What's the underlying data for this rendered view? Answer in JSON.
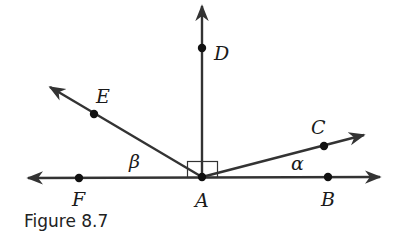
{
  "figure": {
    "caption": "Figure 8.7",
    "points": {
      "A": {
        "label": "A",
        "x": 202,
        "y": 177
      },
      "B": {
        "label": "B",
        "x": 328,
        "y": 177
      },
      "C": {
        "label": "C",
        "x": 324,
        "y": 146
      },
      "D": {
        "label": "D",
        "x": 202,
        "y": 48
      },
      "E": {
        "label": "E",
        "x": 94,
        "y": 114
      },
      "F": {
        "label": "F",
        "x": 79,
        "y": 178
      }
    },
    "angles": {
      "alpha": {
        "label": "α"
      },
      "beta": {
        "label": "β"
      }
    },
    "line_color": "#333333"
  }
}
